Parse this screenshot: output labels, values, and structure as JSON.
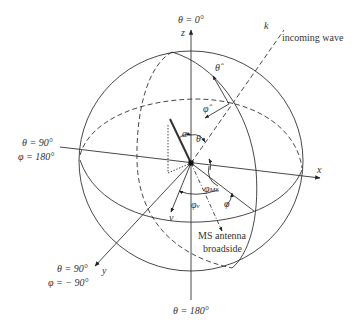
{
  "diagram": {
    "type": "spherical-coordinate-system",
    "stroke_color": "#333333",
    "labels": {
      "top_pole": "θ = 0°",
      "z_axis": "z",
      "k_vector": "k",
      "incoming_wave": "incoming wave",
      "theta_hat": "θ̂",
      "phi_hat": "φ̂",
      "alpha": "α",
      "theta": "θ",
      "left_theta": "θ = 90°",
      "left_phi": "φ = 180°",
      "x_axis": "x",
      "phi_ms": "φ",
      "phi_ms_sub": "MS",
      "phi_v": "φ",
      "phi_v_sub": "v",
      "phi": "φ",
      "v_vector": "v",
      "ms_antenna_line1": "MS antenna",
      "ms_antenna_line2": "broadside",
      "y_theta": "θ = 90°",
      "y_phi": "φ = − 90°",
      "y_axis": "y",
      "bottom_pole": "θ = 180°"
    }
  }
}
